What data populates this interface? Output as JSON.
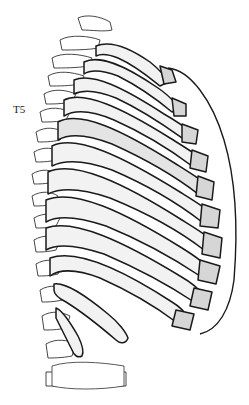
{
  "figure": {
    "labels": [
      {
        "id": "t5",
        "text": "T5"
      }
    ]
  },
  "colors": {
    "background": "#ffffff",
    "outline": "#1a1a1a",
    "rib_fill": "#f2f2f2",
    "cartilage_fill": "#d6d6d6",
    "spine_fill": "#ffffff",
    "highlight_rib": "#e4e4e4"
  }
}
